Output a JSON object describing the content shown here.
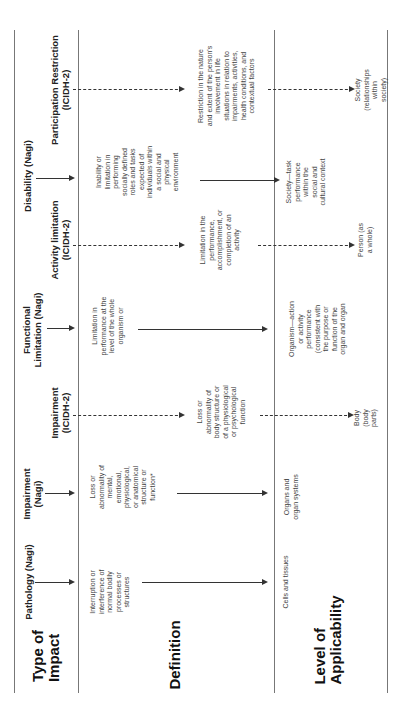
{
  "row_labels": {
    "type_of_impact": "Type of\nImpact",
    "definition": "Definition",
    "level_of_applicability": "Level of\nApplicability"
  },
  "columns": [
    {
      "id": "pathology-nagi",
      "header": "Pathology (Nagi)",
      "framework": "Nagi",
      "definition": "Interruption or\ninterference of\nnormal bodily\nprocesses or\nstructures",
      "level": "Cells and tissues",
      "arrow_style": "solid"
    },
    {
      "id": "impairment-nagi",
      "header": "Impairment\n(Nagi)",
      "framework": "Nagi",
      "definition": "Loss or\nabnormality of\nmental,\nemotional,\nphysiological,\nor anatomical\nstructure or\nfunction*",
      "level": "Organs and\norgan systems",
      "arrow_style": "solid"
    },
    {
      "id": "impairment-icidh2",
      "header": "Impairment\n(ICIDH-2)",
      "framework": "ICIDH-2",
      "definition": "Loss or\nabnormality of\nbody structure or\nof a physiological\nor psychological\nfunction",
      "level": "Body (body parts)",
      "arrow_style": "dashed"
    },
    {
      "id": "functional-limitation-nagi",
      "header": "Functional\nLimitation (Nagi)",
      "framework": "Nagi",
      "definition": "Limitation in\nperformance at the\nlevel of the whole\norganism or",
      "level": "Organism—action\nor activity\nperformance\n(consistent with\nthe purpose or\nfunction of the\norgan and organ",
      "arrow_style": "solid"
    },
    {
      "id": "activity-limitation-icidh2",
      "header": "Activity limitation\n(ICIDH-2)",
      "framework": "ICIDH-2",
      "definition": "Limitation in the\nperformance,\naccomplishment, or\ncompletion of  an\nactivity",
      "level": "Person (as a whole)",
      "arrow_style": "dashed"
    },
    {
      "id": "disability-nagi",
      "header": "Disability (Nagi)",
      "framework": "Nagi",
      "definition": "Inability or\nlimitation in\nperforming\nsocially defined\nroles and tasks\nexpected of\nindividuals within\na social and\nphysical\nenvironment",
      "level": "Society—task\nperformance\nwithin the\nsocial and\ncultural context",
      "arrow_style": "solid"
    },
    {
      "id": "participation-restriction-icidh2",
      "header": "Participation Restriction\n(ICIDH-2)",
      "framework": "ICIDH-2",
      "definition": "Restriction in the nature\nand extent of the person's\ninvolvement  in life\nsituations in relation to\nimpairments, activities,\nhealth conditions, and\ncontextual factors",
      "level": "Society (relationships\nwithin society)",
      "arrow_style": "dashed"
    }
  ]
}
